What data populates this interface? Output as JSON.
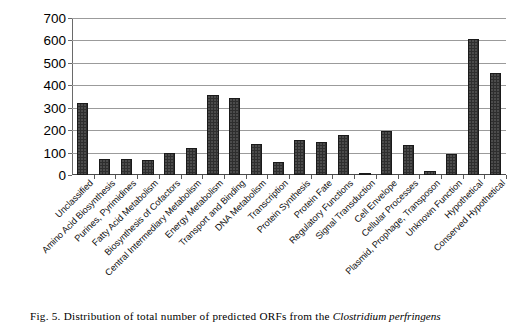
{
  "caption": {
    "prefix": "Fig. 5. Distribution of total number of predicted ORFs from the ",
    "italic": "Clostridium perfringens"
  },
  "chart_data": {
    "type": "bar",
    "title": "",
    "xlabel": "",
    "ylabel": "",
    "ylim": [
      0,
      700
    ],
    "ytick_step": 100,
    "grid": true,
    "legend": "none",
    "bar_color": "#2e2e2e",
    "yticks": [
      "0",
      "100",
      "200",
      "300",
      "400",
      "500",
      "600",
      "700"
    ],
    "categories": [
      "Unclassified",
      "Amino Acid Biosynthesis",
      "Purines, Pyrimidines",
      "Fatty Acid Metabolism",
      "Biosynthesis of Cofactors",
      "Central Intermediary Metabolism",
      "Energy Metabolism",
      "Transport and Binding",
      "DNA Metabolism",
      "Transcription",
      "Protein Synthesis",
      "Protein Fate",
      "Regulatory Functions",
      "Signal Transduction",
      "Cell Envelope",
      "Cellular Processes",
      "Plasmid, Prophage, Transposon",
      "Unknown Function",
      "Hypothetical",
      "Conserved Hypothetical"
    ],
    "values": [
      320,
      72,
      72,
      65,
      100,
      120,
      355,
      345,
      140,
      60,
      155,
      145,
      180,
      5,
      195,
      135,
      20,
      95,
      605,
      455
    ]
  }
}
